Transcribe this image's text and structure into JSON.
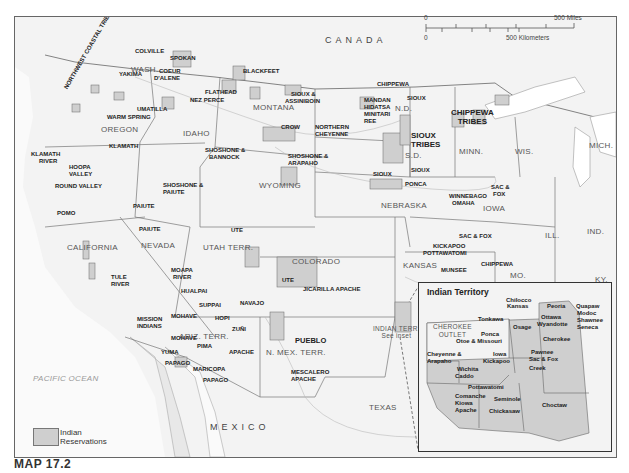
{
  "caption": "MAP 17.2",
  "country_labels": {
    "canada": "CANADA",
    "mexico": "MEXICO",
    "pacific": "PACIFIC OCEAN"
  },
  "scale": {
    "zero_top": "0",
    "miles": "500 Miles",
    "zero_bottom": "0",
    "km": "500 Kilometers"
  },
  "legend": {
    "label_line1": "Indian",
    "label_line2": "Reservations",
    "swatch_color": "#cfcfcf"
  },
  "states": {
    "wash": "WASH.",
    "oregon": "OREGON",
    "idaho": "IDAHO",
    "montana": "MONTANA",
    "nd": "N.D.",
    "sd": "S.D.",
    "minn": "MINN.",
    "wis": "WIS.",
    "mich": "MICH.",
    "wyoming": "WYOMING",
    "nebraska": "NEBRASKA",
    "iowa": "IOWA",
    "ill": "ILL.",
    "ind": "IND.",
    "ky": "KY.",
    "mo": "MO.",
    "kansas": "KANSAS",
    "colorado": "COLORADO",
    "utah": "UTAH TERR.",
    "nevada": "NEVADA",
    "california": "CALIFORNIA",
    "ariz": "ARIZ. TERR.",
    "nmex": "N. MEX. TERR.",
    "texas": "TEXAS",
    "indian_terr": "INDIAN TERR.",
    "see_inset": "See inset"
  },
  "reservations": {
    "colville": "COLVILLE",
    "spokan": "SPOKAN",
    "coeur1": "COEUR",
    "coeur2": "D'ALENE",
    "yakima": "YAKIMA",
    "nw_coastal": "NORTHWEST COASTAL TRIBES",
    "umatilla": "UMATILLA",
    "warm_spring": "WARM SPRING",
    "klamath": "KLAMATH",
    "klamath_river1": "KLAMATH",
    "klamath_river2": "RIVER",
    "hoopa1": "HOOPA",
    "hoopa2": "VALLEY",
    "round_valley": "ROUND VALLEY",
    "pomo": "POMO",
    "nez_perce": "NEZ PERCE",
    "flathead": "FLATHEAD",
    "blackfeet": "BLACKFEET",
    "sioux_assiniboin1": "SIOUX &",
    "sioux_assiniboin2": "ASSINIBOIN",
    "crow": "CROW",
    "n_cheyenne1": "NORTHERN",
    "n_cheyenne2": "CHEYENNE",
    "shoshone_bannock1": "SHOSHONE &",
    "shoshone_bannock2": "BANNOCK",
    "shoshone_arapaho1": "SHOSHONE &",
    "shoshone_arapaho2": "ARAPAHO",
    "mandan1": "MANDAN",
    "mandan2": "HIDATSA",
    "mandan3": "MINITARI",
    "mandan4": "REE",
    "chippewa_nd": "CHIPPEWA",
    "sioux_nd": "SIOUX",
    "sioux_tribes1": "SIOUX",
    "sioux_tribes2": "TRIBES",
    "chippewa_tribes1": "CHIPPEWA",
    "chippewa_tribes2": "TRIBES",
    "sioux_ne1": "SIOUX",
    "sioux_ne2": "SIOUX",
    "ponca": "PONCA",
    "winnebago": "WINNEBAGO",
    "omaha": "OMAHA",
    "sac_fox_ia1": "SAC &",
    "sac_fox_ia2": "FOX",
    "sac_fox_ks": "SAC & FOX",
    "kickapoo": "KICKAPOO",
    "pottawatomi": "POTTAWATOMI",
    "munsee": "MUNSEE",
    "chippewa_ks": "CHIPPEWA",
    "shoshone_paiute1": "SHOSHONE &",
    "shoshone_paiute2": "PAIUTE",
    "paiute1": "PAIUTE",
    "paiute2": "PAIUTE",
    "ute": "UTE",
    "ute2": "UTE",
    "jicarilla": "JICARILLA APACHE",
    "moapa1": "MOAPA",
    "moapa2": "RIVER",
    "tule1": "TULE",
    "tule2": "RIVER",
    "hualpai": "HUALPAI",
    "suppai": "SUPPAI",
    "navajo": "NAVAJO",
    "hopi": "HOPI",
    "zuni": "ZUÑI",
    "mohave1": "MOHAVE",
    "mohave2": "MOHAVE",
    "mission1": "MISSION",
    "mission2": "INDIANS",
    "yuma": "YUMA",
    "pima": "PIMA",
    "apache": "APACHE",
    "papago1": "PAPAGO",
    "maricopa": "MARICOPA",
    "papago2": "PAPAGO",
    "pueblo": "PUEBLO",
    "mescalero1": "MESCALERO",
    "mescalero2": "APACHE"
  },
  "inset": {
    "title": "Indian Territory",
    "labels": {
      "chilocco": "Chilocco",
      "kansas": "Kansas",
      "peoria": "Peoria",
      "quapaw": "Quapaw",
      "modoc": "Modoc",
      "shawnee": "Shawnee",
      "seneca": "Seneca",
      "ottawa": "Ottawa",
      "wyandotte": "Wyandotte",
      "cherokee_outlet1": "CHEROKEE",
      "cherokee_outlet2": "OUTLET",
      "tonkawa": "Tonkawa",
      "osage": "Osage",
      "ponca": "Ponca",
      "otoe": "Otoe & Missouri",
      "cherokee": "Cherokee",
      "cheyenne1": "Cheyenne &",
      "cheyenne2": "Arapaho",
      "iowa": "Iowa",
      "kickapoo": "Kickapoo",
      "pawnee": "Pawnee",
      "sac_fox": "Sac & Fox",
      "wichita": "Wichita",
      "caddo": "Caddo",
      "creek": "Creek",
      "pottawatomi": "Pottawatomi",
      "comanche": "Comanche",
      "kiowa": "Kiowa",
      "apache": "Apache",
      "seminole": "Seminole",
      "chickasaw": "Chickasaw",
      "choctaw": "Choctaw"
    }
  }
}
